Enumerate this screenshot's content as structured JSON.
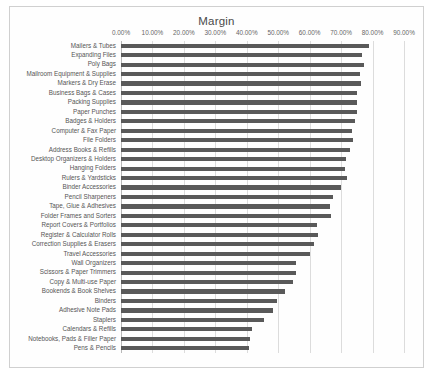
{
  "chart_data": {
    "type": "bar",
    "orientation": "horizontal",
    "title": "Margin",
    "xlabel": "",
    "ylabel": "",
    "xlim": [
      0,
      0.9
    ],
    "xticks": [
      "0.00%",
      "10.00%",
      "20.00%",
      "30.00%",
      "40.00%",
      "50.00%",
      "60.00%",
      "70.00%",
      "80.00%",
      "90.00%"
    ],
    "xtick_values": [
      0,
      10,
      20,
      30,
      40,
      50,
      60,
      70,
      80,
      90
    ],
    "grid": true,
    "legend": false,
    "bar_color": "#595959",
    "categories": [
      "Mailers & Tubes",
      "Expanding Files",
      "Poly Bags",
      "Mailroom Equipment & Supplies",
      "Markers & Dry Erase",
      "Business Bags & Cases",
      "Packing Supplies",
      "Paper Punches",
      "Badges & Holders",
      "Computer & Fax Paper",
      "File Folders",
      "Address Books & Refills",
      "Desktop Organizers & Holders",
      "Hanging Folders",
      "Rulers & Yardsticks",
      "Binder Accessories",
      "Pencil Sharpeners",
      "Tape, Glue & Adhesives",
      "Folder Frames and Sorters",
      "Report Covers & Portfolios",
      "Register & Calculator Rolls",
      "Correction Supplies & Erasers",
      "Travel Accessories",
      "Wall Organizers",
      "Scissors & Paper Trimmers",
      "Copy & Multi-use Paper",
      "Bookends & Book Shelves",
      "Binders",
      "Adhesive Note Pads",
      "Staplers",
      "Calendars & Refills",
      "Notebooks, Pads & Filler Paper",
      "Pens & Pencils"
    ],
    "values": [
      78.8,
      76.8,
      77.2,
      75.9,
      76.4,
      75.2,
      74.9,
      74.9,
      74.3,
      73.6,
      73.9,
      72.8,
      71.7,
      71.1,
      71.9,
      70.1,
      67.5,
      66.4,
      66.7,
      62.2,
      62.6,
      61.3,
      60.1,
      55.5,
      55.7,
      54.8,
      52.3,
      49.7,
      48.4,
      45.4,
      41.7,
      41.0,
      40.7
    ]
  }
}
